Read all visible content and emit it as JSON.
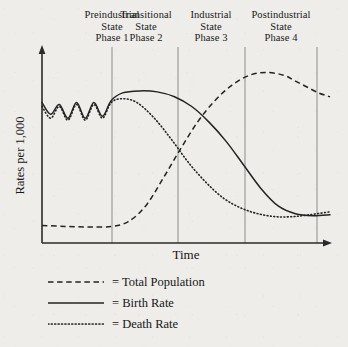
{
  "figure": {
    "background_color": "#eeedea",
    "ink_color": "#1a1a1a",
    "divider_color": "#8d8d8d"
  },
  "axes": {
    "x_label": "Time",
    "y_label": "Rates per 1,000",
    "x_axis_has_arrow": true,
    "y_axis_has_arrow": true
  },
  "phases": [
    {
      "line1": "Preindustrial",
      "line2": "State",
      "line3": "Phase 1"
    },
    {
      "line1": "Transitional",
      "line2": "State",
      "line3": "Phase 2"
    },
    {
      "line1": "Industrial",
      "line2": "State",
      "line3": "Phase 3"
    },
    {
      "line1": "Postindustrial",
      "line2": "State",
      "line3": "Phase 4"
    }
  ],
  "legend": [
    {
      "style": "dashed",
      "prefix": "=",
      "label": "Total Population"
    },
    {
      "style": "solid",
      "prefix": "=",
      "label": "Birth Rate"
    },
    {
      "style": "dotted",
      "prefix": "=",
      "label": "Death Rate"
    }
  ],
  "chart_data": {
    "type": "line",
    "title": "",
    "xlabel": "Time",
    "ylabel": "Rates per 1,000",
    "xlim": [
      0,
      100
    ],
    "ylim": [
      0,
      100
    ],
    "grid": false,
    "legend_position": "below",
    "x_tick_labels": [],
    "y_tick_labels": [],
    "phase_boundaries_x": [
      24.3,
      47.2,
      70.5,
      95.5
    ],
    "series": [
      {
        "name": "Total Population",
        "style": "dashed",
        "points": [
          [
            0,
            9
          ],
          [
            8,
            8.5
          ],
          [
            16,
            8.2
          ],
          [
            24,
            8.5
          ],
          [
            30,
            11
          ],
          [
            36,
            19
          ],
          [
            42,
            33
          ],
          [
            48,
            48
          ],
          [
            54,
            62
          ],
          [
            60,
            73
          ],
          [
            66,
            81
          ],
          [
            72,
            86
          ],
          [
            78,
            87.5
          ],
          [
            84,
            86
          ],
          [
            88,
            83
          ],
          [
            92,
            80
          ],
          [
            96,
            77
          ],
          [
            100,
            75
          ]
        ]
      },
      {
        "name": "Birth Rate",
        "style": "solid",
        "points": [
          [
            0,
            72
          ],
          [
            3,
            66
          ],
          [
            6,
            71
          ],
          [
            9,
            64
          ],
          [
            12,
            72
          ],
          [
            15,
            64
          ],
          [
            18,
            72
          ],
          [
            21,
            65
          ],
          [
            24,
            73
          ],
          [
            28,
            77
          ],
          [
            34,
            78
          ],
          [
            40,
            77.5
          ],
          [
            46,
            75
          ],
          [
            52,
            70
          ],
          [
            58,
            62
          ],
          [
            64,
            52
          ],
          [
            70,
            40
          ],
          [
            76,
            28
          ],
          [
            82,
            19
          ],
          [
            88,
            15
          ],
          [
            94,
            14
          ],
          [
            100,
            14.5
          ]
        ]
      },
      {
        "name": "Death Rate",
        "style": "dotted",
        "points": [
          [
            0,
            70
          ],
          [
            3,
            64
          ],
          [
            6,
            70
          ],
          [
            9,
            63
          ],
          [
            12,
            71
          ],
          [
            15,
            63
          ],
          [
            18,
            71
          ],
          [
            21,
            64
          ],
          [
            24,
            72
          ],
          [
            28,
            74
          ],
          [
            33,
            72
          ],
          [
            39,
            64
          ],
          [
            45,
            53
          ],
          [
            51,
            41
          ],
          [
            57,
            31
          ],
          [
            63,
            23
          ],
          [
            69,
            18
          ],
          [
            75,
            15
          ],
          [
            81,
            13.5
          ],
          [
            87,
            13.5
          ],
          [
            93,
            14.5
          ],
          [
            100,
            16
          ]
        ]
      }
    ]
  }
}
